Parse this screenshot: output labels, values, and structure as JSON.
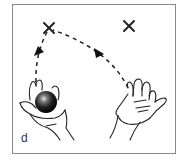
{
  "figure": {
    "panel_label": "d",
    "markers": [
      {
        "name": "left-target",
        "symbol": "×",
        "x": 49,
        "y": 28
      },
      {
        "name": "right-target",
        "symbol": "×",
        "x": 129,
        "y": 26
      }
    ],
    "colors": {
      "frame": "#8a8a8a",
      "ink": "#222222",
      "ball_dark": "#111111",
      "ball_highlight": "#dddddd"
    }
  }
}
